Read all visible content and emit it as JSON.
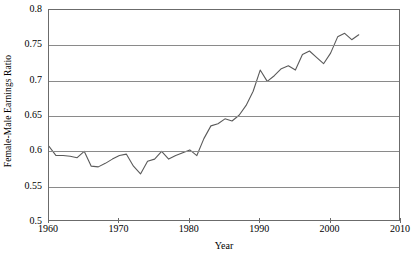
{
  "chart_data": {
    "type": "line",
    "title": "",
    "xlabel": "Year",
    "ylabel": "Female-Male Earnings Ratio",
    "xlim": [
      1960,
      2010
    ],
    "ylim": [
      0.5,
      0.8
    ],
    "xticks": [
      1960,
      1970,
      1980,
      1990,
      2000,
      2010
    ],
    "xtick_labels": [
      "1960",
      "1970",
      "1980",
      "1990",
      "2000",
      "2010"
    ],
    "yticks": [
      0.5,
      0.55,
      0.6,
      0.65,
      0.7,
      0.75,
      0.8
    ],
    "ytick_labels": [
      "0.5",
      "0.55",
      "0.6",
      "0.65",
      "0.7",
      "0.75",
      "0.8"
    ],
    "grid": "horizontal",
    "legend": "none",
    "line_color": "#5a5a5a",
    "series": [
      {
        "name": "Female-Male Earnings Ratio",
        "x": [
          1960,
          1961,
          1962,
          1963,
          1964,
          1965,
          1966,
          1967,
          1968,
          1969,
          1970,
          1971,
          1972,
          1973,
          1974,
          1975,
          1976,
          1977,
          1978,
          1979,
          1980,
          1981,
          1982,
          1983,
          1984,
          1985,
          1986,
          1987,
          1988,
          1989,
          1990,
          1991,
          1992,
          1993,
          1994,
          1995,
          1996,
          1997,
          1998,
          1999,
          2000,
          2001,
          2002,
          2003,
          2004
        ],
        "values": [
          0.607,
          0.594,
          0.594,
          0.593,
          0.591,
          0.6,
          0.579,
          0.578,
          0.583,
          0.589,
          0.594,
          0.596,
          0.579,
          0.568,
          0.586,
          0.589,
          0.6,
          0.589,
          0.594,
          0.598,
          0.602,
          0.594,
          0.618,
          0.636,
          0.639,
          0.646,
          0.643,
          0.651,
          0.665,
          0.685,
          0.715,
          0.699,
          0.707,
          0.717,
          0.721,
          0.715,
          0.737,
          0.742,
          0.733,
          0.724,
          0.739,
          0.762,
          0.767,
          0.758,
          0.765
        ]
      }
    ]
  }
}
